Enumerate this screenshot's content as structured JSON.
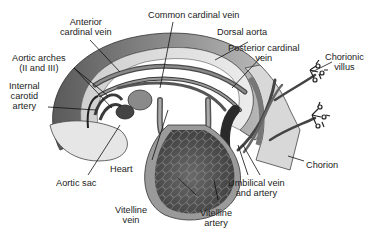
{
  "diagram": {
    "type": "anatomical illustration",
    "colors": {
      "background": "#ffffff",
      "dark_vessel": "#3a3a3a",
      "mid_gray": "#7a7a7a",
      "light_gray": "#c8c8c8",
      "pale": "#e4e4e4",
      "line": "#111111"
    }
  },
  "labels": {
    "common_cardinal_vein": {
      "lines": [
        "Common cardinal vein"
      ]
    },
    "anterior_cardinal_vein": {
      "lines": [
        "Anterior",
        "cardinal vein"
      ]
    },
    "dorsal_aorta": {
      "lines": [
        "Dorsal aorta"
      ]
    },
    "aortic_arches": {
      "lines": [
        "Aortic arches",
        "(II and III)"
      ]
    },
    "posterior_cardinal_vein": {
      "lines": [
        "Posterior cardinal",
        "vein"
      ]
    },
    "chorionic_villus": {
      "lines": [
        "Chorionic",
        "villus"
      ]
    },
    "internal_carotid_artery": {
      "lines": [
        "Internal",
        "carotid",
        "artery"
      ]
    },
    "chorion": {
      "lines": [
        "Chorion"
      ]
    },
    "heart": {
      "lines": [
        "Heart"
      ]
    },
    "aortic_sac": {
      "lines": [
        "Aortic sac"
      ]
    },
    "umbilical_vein_artery": {
      "lines": [
        "Umbilical vein",
        "and artery"
      ]
    },
    "vitelline_vein": {
      "lines": [
        "Vitelline",
        "vein"
      ]
    },
    "vitelline_artery": {
      "lines": [
        "Vitelline",
        "artery"
      ]
    }
  }
}
